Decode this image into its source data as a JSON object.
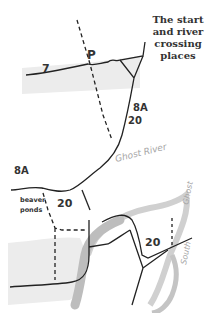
{
  "title": {
    "lines": [
      "The start",
      "and river",
      "crossing",
      "places"
    ]
  },
  "labels": {
    "parking": "P",
    "trail_7": "7",
    "trail_8a_upper": "8A",
    "trail_20_upper": "20",
    "trail_8a_left": "8A",
    "trail_20_ponds": "20",
    "trail_20_lower": "20",
    "beaver_ponds_line1": "beaver",
    "beaver_ponds_line2": "ponds",
    "ghost_river": "Ghost River",
    "ghost": "Ghost",
    "south": "South"
  },
  "colors": {
    "trail": "#222222",
    "river": "#b8b8b8",
    "flats": "#ececec",
    "label": "#333333",
    "river_label": "#a6a6a6"
  }
}
